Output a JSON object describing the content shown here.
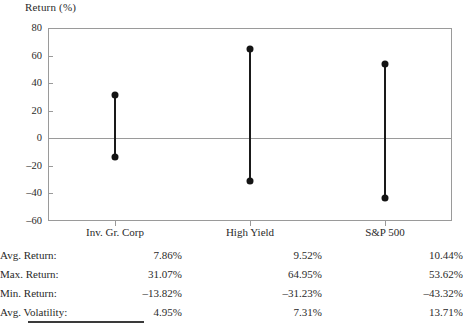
{
  "chart_data": {
    "type": "bar",
    "subtype": "high-low range plot",
    "title": "",
    "ylabel": "Return (%)",
    "xlabel": "",
    "ylim": [
      -60,
      80
    ],
    "yticks": [
      80,
      60,
      40,
      20,
      0,
      -20,
      -40,
      -60
    ],
    "ytick_labels": [
      "80",
      "60",
      "40",
      "20",
      "0",
      "–20",
      "–40",
      "–60"
    ],
    "grid": false,
    "zero_line": true,
    "legend": "none",
    "categories": [
      "Inv. Gr. Corp",
      "High Yield",
      "S&P 500"
    ],
    "series": [
      {
        "name": "Max. Return",
        "values": [
          31.07,
          64.95,
          53.62
        ]
      },
      {
        "name": "Min. Return",
        "values": [
          -13.82,
          -31.23,
          -43.32
        ]
      }
    ],
    "annotations": []
  },
  "axis": {
    "y_title": "Return (%)",
    "y_tick_labels": [
      "80",
      "60",
      "40",
      "20",
      "0",
      "–20",
      "–40",
      "–60"
    ],
    "x_tick_labels": [
      "Inv. Gr. Corp",
      "High Yield",
      "S&P 500"
    ]
  },
  "table": {
    "row_labels": [
      "Avg. Return:",
      "Max. Return:",
      "Min. Return:",
      "Avg. Volatility:"
    ],
    "columns": [
      "Inv. Gr. Corp",
      "High Yield",
      "S&P 500"
    ],
    "rows": [
      {
        "label": "Avg. Return:",
        "c1": "7.86%",
        "c2": "9.52%",
        "c3": "10.44%"
      },
      {
        "label": "Max. Return:",
        "c1": "31.07%",
        "c2": "64.95%",
        "c3": "53.62%"
      },
      {
        "label": "Min. Return:",
        "c1": "–13.82%",
        "c2": "–31.23%",
        "c3": "–43.32%"
      },
      {
        "label": "Avg. Volatility:",
        "c1": "4.95%",
        "c2": "7.31%",
        "c3": "13.71%"
      }
    ]
  },
  "colors": {
    "marker": "#141414",
    "line": "#1a1a1a",
    "frame": "#9a9a9a",
    "text": "#2a2a2a"
  }
}
